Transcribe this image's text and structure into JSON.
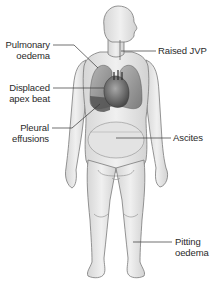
{
  "figure": {
    "colors": {
      "skin": "#e9e9e9",
      "skin_shade": "#cfcfcf",
      "outline": "#7a7a7a",
      "lung": "#9a9a9a",
      "heart": "#6e6e6e",
      "effusion": "#5a5a5a",
      "leader_line": "#333333",
      "text": "#2a2a2a"
    },
    "labels": {
      "pulmonary_oedema": {
        "line1": "Pulmonary",
        "line2": "oedema"
      },
      "raised_jvp": {
        "line1": "Raised JVP"
      },
      "displaced_apex_beat": {
        "line1": "Displaced",
        "line2": "apex beat"
      },
      "pleural_effusions": {
        "line1": "Pleural",
        "line2": "effusions"
      },
      "ascites": {
        "line1": "Ascites"
      },
      "pitting_oedema": {
        "line1": "Pitting",
        "line2": "oedema"
      }
    }
  }
}
